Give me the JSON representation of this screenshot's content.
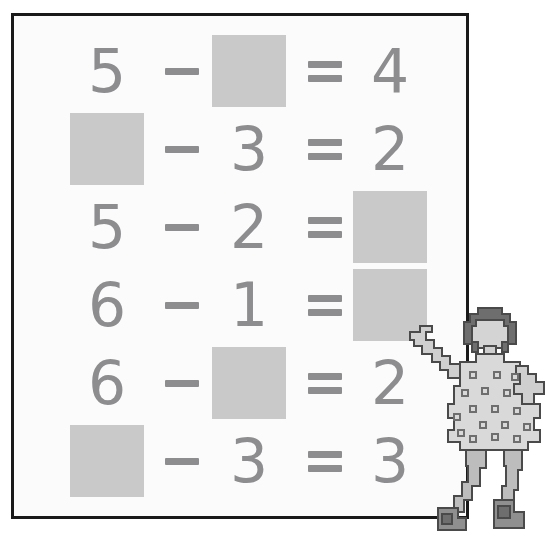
{
  "worksheet": {
    "title": "Subtraction worksheet with missing numbers",
    "panel": {
      "background_color": "#fbfbfb",
      "border_color": "#191919"
    },
    "colors": {
      "digit_color": "#8d8d90",
      "blank_square_color": "#c9c9c9",
      "page_background": "#ffffff",
      "figure_skin": "#d8d8d8",
      "figure_dress": "#d2d2d2",
      "figure_hair": "#6e6e6e",
      "figure_outline": "#4a4a4a",
      "figure_shoe": "#9a9a9a"
    },
    "blank_label": "blank-square",
    "operators": {
      "minus": "−",
      "equals": "="
    },
    "rows": [
      {
        "id": "row-1",
        "a": {
          "kind": "digit",
          "value": "5"
        },
        "op": {
          "kind": "operator",
          "value": "−"
        },
        "b": {
          "kind": "blank",
          "value": ""
        },
        "eq": {
          "kind": "operator",
          "value": "="
        },
        "c": {
          "kind": "digit",
          "value": "4"
        }
      },
      {
        "id": "row-2",
        "a": {
          "kind": "blank",
          "value": ""
        },
        "op": {
          "kind": "operator",
          "value": "−"
        },
        "b": {
          "kind": "digit",
          "value": "3"
        },
        "eq": {
          "kind": "operator",
          "value": "="
        },
        "c": {
          "kind": "digit",
          "value": "2"
        }
      },
      {
        "id": "row-3",
        "a": {
          "kind": "digit",
          "value": "5"
        },
        "op": {
          "kind": "operator",
          "value": "−"
        },
        "b": {
          "kind": "digit",
          "value": "2"
        },
        "eq": {
          "kind": "operator",
          "value": "="
        },
        "c": {
          "kind": "blank",
          "value": ""
        }
      },
      {
        "id": "row-4",
        "a": {
          "kind": "digit",
          "value": "6"
        },
        "op": {
          "kind": "operator",
          "value": "−"
        },
        "b": {
          "kind": "digit",
          "value": "1"
        },
        "eq": {
          "kind": "operator",
          "value": "="
        },
        "c": {
          "kind": "blank",
          "value": ""
        }
      },
      {
        "id": "row-5",
        "a": {
          "kind": "digit",
          "value": "6"
        },
        "op": {
          "kind": "operator",
          "value": "−"
        },
        "b": {
          "kind": "blank",
          "value": ""
        },
        "eq": {
          "kind": "operator",
          "value": "="
        },
        "c": {
          "kind": "digit",
          "value": "2"
        }
      },
      {
        "id": "row-6",
        "a": {
          "kind": "blank",
          "value": ""
        },
        "op": {
          "kind": "operator",
          "value": "−"
        },
        "b": {
          "kind": "digit",
          "value": "3"
        },
        "eq": {
          "kind": "operator",
          "value": "="
        },
        "c": {
          "kind": "digit",
          "value": "3"
        }
      }
    ]
  },
  "figure": {
    "name": "girl-pointing-at-board"
  }
}
